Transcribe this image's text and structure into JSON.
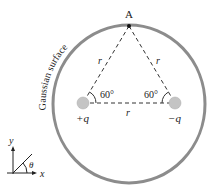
{
  "diagram": {
    "surface_label": "Gaussian surface",
    "point_label": "A",
    "side_labels": [
      "r",
      "r",
      "r"
    ],
    "angle_left": "60°",
    "angle_right": "60°",
    "charge_positive": "+q",
    "charge_negative": "−q",
    "axes": {
      "y_label": "y",
      "x_label": "x",
      "angle_label": "θ"
    },
    "colors": {
      "surface": "#8a8a8a",
      "charge": "#c4c4c4",
      "line": "#333333"
    }
  }
}
